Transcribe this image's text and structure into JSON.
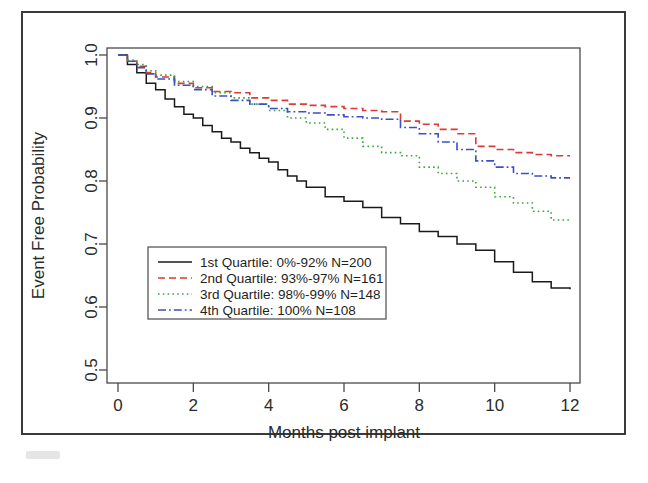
{
  "figure": {
    "background": "#ffffff",
    "frame_color": "#3a3a3a"
  },
  "chart_data": {
    "type": "line",
    "subtype": "kaplan-meier-step",
    "title": "",
    "xlabel": "Months post implant",
    "ylabel": "Event Free Probability",
    "xlim": [
      0,
      12
    ],
    "ylim": [
      0.5,
      1.0
    ],
    "xticks": [
      0,
      2,
      4,
      6,
      8,
      10,
      12
    ],
    "xticklabels": [
      "0",
      "2",
      "4",
      "6",
      "8",
      "10",
      "12"
    ],
    "yticks": [
      0.5,
      0.6,
      0.7,
      0.8,
      0.9,
      1.0
    ],
    "yticklabels": [
      "0.5",
      "0.6",
      "0.7",
      "0.8",
      "0.9",
      "1.0"
    ],
    "grid": false,
    "legend_position": "lower-left-inside",
    "series": [
      {
        "name": "1st Quartile",
        "range_label": "0%-92%",
        "n": 200,
        "n_label": "N=200",
        "color": "#1a1a1a",
        "dash": "solid",
        "legend_label": "1st Quartile: 0%-92%   N=200",
        "x": [
          0,
          0.25,
          0.5,
          0.75,
          1.0,
          1.25,
          1.5,
          1.75,
          2.0,
          2.25,
          2.5,
          2.75,
          3.0,
          3.25,
          3.5,
          3.75,
          4.0,
          4.25,
          4.5,
          4.75,
          5.0,
          5.5,
          6.0,
          6.5,
          7.0,
          7.5,
          8.0,
          8.5,
          9.0,
          9.5,
          10.0,
          10.5,
          11.0,
          11.5,
          12.0
        ],
        "y": [
          1.0,
          0.985,
          0.972,
          0.955,
          0.945,
          0.93,
          0.918,
          0.906,
          0.9,
          0.888,
          0.878,
          0.868,
          0.862,
          0.852,
          0.845,
          0.836,
          0.83,
          0.818,
          0.808,
          0.8,
          0.79,
          0.775,
          0.768,
          0.758,
          0.742,
          0.732,
          0.72,
          0.712,
          0.7,
          0.69,
          0.672,
          0.655,
          0.64,
          0.63,
          0.628
        ]
      },
      {
        "name": "2nd Quartile",
        "range_label": "93%-97%",
        "n": 161,
        "n_label": "N=161",
        "color": "#d93b35",
        "dash": "dashed",
        "legend_label": "2nd Quartile: 93%-97%   N=161",
        "x": [
          0,
          0.25,
          0.5,
          0.75,
          1.0,
          1.5,
          2.0,
          2.5,
          3.0,
          3.5,
          4.0,
          4.5,
          5.0,
          5.5,
          6.0,
          6.5,
          7.0,
          7.5,
          8.0,
          8.5,
          9.0,
          9.5,
          10.0,
          10.5,
          11.0,
          11.5,
          12.0
        ],
        "y": [
          1.0,
          0.99,
          0.982,
          0.972,
          0.965,
          0.955,
          0.948,
          0.942,
          0.94,
          0.932,
          0.928,
          0.922,
          0.92,
          0.918,
          0.915,
          0.912,
          0.91,
          0.895,
          0.89,
          0.882,
          0.875,
          0.855,
          0.85,
          0.845,
          0.842,
          0.84,
          0.84
        ]
      },
      {
        "name": "3rd Quartile",
        "range_label": "98%-99%",
        "n": 148,
        "n_label": "N=148",
        "color": "#3aa83a",
        "dash": "dotted",
        "legend_label": "3rd Quartile: 98%-99%   N=148",
        "x": [
          0,
          0.25,
          0.5,
          0.75,
          1.0,
          1.5,
          2.0,
          2.5,
          3.0,
          3.5,
          4.0,
          4.5,
          5.0,
          5.5,
          6.0,
          6.5,
          7.0,
          7.5,
          8.0,
          8.5,
          9.0,
          9.5,
          10.0,
          10.5,
          11.0,
          11.5,
          12.0
        ],
        "y": [
          1.0,
          0.992,
          0.985,
          0.975,
          0.968,
          0.958,
          0.95,
          0.94,
          0.932,
          0.922,
          0.912,
          0.9,
          0.892,
          0.882,
          0.868,
          0.855,
          0.845,
          0.84,
          0.822,
          0.812,
          0.8,
          0.79,
          0.775,
          0.765,
          0.752,
          0.738,
          0.735
        ]
      },
      {
        "name": "4th Quartile",
        "range_label": "100%",
        "n": 108,
        "n_label": "N=108",
        "color": "#3b4fc8",
        "dash": "dashdot",
        "legend_label": "4th Quartile:  100%   N=108",
        "x": [
          0,
          0.25,
          0.5,
          0.75,
          1.0,
          1.5,
          2.0,
          2.5,
          3.0,
          3.5,
          4.0,
          4.5,
          5.0,
          5.5,
          6.0,
          6.5,
          7.0,
          7.5,
          8.0,
          8.5,
          9.0,
          9.5,
          10.0,
          10.5,
          11.0,
          11.5,
          12.0
        ],
        "y": [
          1.0,
          0.99,
          0.98,
          0.97,
          0.962,
          0.952,
          0.945,
          0.935,
          0.928,
          0.922,
          0.915,
          0.91,
          0.908,
          0.905,
          0.902,
          0.9,
          0.898,
          0.885,
          0.875,
          0.862,
          0.85,
          0.832,
          0.822,
          0.812,
          0.808,
          0.805,
          0.805
        ]
      }
    ]
  },
  "legend": {
    "entries": [
      {
        "label": "1st Quartile: 0%-92%   N=200",
        "color": "#1a1a1a",
        "dash": "solid"
      },
      {
        "label": "2nd Quartile: 93%-97%   N=161",
        "color": "#d93b35",
        "dash": "dashed"
      },
      {
        "label": "3rd Quartile: 98%-99%   N=148",
        "color": "#3aa83a",
        "dash": "dotted"
      },
      {
        "label": "4th Quartile:  100%   N=108",
        "color": "#3b4fc8",
        "dash": "dashdot"
      }
    ]
  }
}
